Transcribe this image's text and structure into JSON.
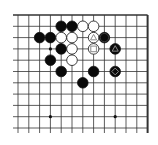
{
  "board": {
    "description": "Partial 19x19 Go board, top-right region (right and top edges visible)",
    "cols_visible": 13,
    "rows_visible": 11,
    "origin_x": 18,
    "origin_y": 15,
    "col_spacing": 10.8,
    "row_spacing": 11.3,
    "right_edge_is_border": true,
    "top_edge_is_border": true,
    "line_color": "#333333",
    "hoshi": [
      [
        3,
        3
      ],
      [
        9,
        3
      ],
      [
        3,
        9
      ],
      [
        9,
        9
      ]
    ],
    "stones": [
      {
        "color": "black",
        "col": 4,
        "row": 1
      },
      {
        "color": "black",
        "col": 5,
        "row": 1
      },
      {
        "color": "white",
        "col": 6,
        "row": 1
      },
      {
        "color": "white",
        "col": 7,
        "row": 1
      },
      {
        "color": "black",
        "col": 2,
        "row": 2
      },
      {
        "color": "black",
        "col": 3,
        "row": 2
      },
      {
        "color": "white",
        "col": 4,
        "row": 2
      },
      {
        "color": "white",
        "col": 5,
        "row": 2
      },
      {
        "color": "white",
        "col": 7,
        "row": 2,
        "mark": "triangle"
      },
      {
        "color": "black",
        "col": 8,
        "row": 2,
        "mark": "circle"
      },
      {
        "color": "black",
        "col": 4,
        "row": 3
      },
      {
        "color": "white",
        "col": 5,
        "row": 3
      },
      {
        "color": "white",
        "col": 7,
        "row": 3,
        "mark": "square"
      },
      {
        "color": "black",
        "col": 9,
        "row": 3,
        "mark": "triangle"
      },
      {
        "color": "black",
        "col": 3,
        "row": 4
      },
      {
        "color": "white",
        "col": 5,
        "row": 4
      },
      {
        "color": "black",
        "col": 4,
        "row": 5
      },
      {
        "color": "black",
        "col": 7,
        "row": 5
      },
      {
        "color": "black",
        "col": 9,
        "row": 5,
        "mark": "diamond"
      },
      {
        "color": "black",
        "col": 6,
        "row": 6
      }
    ],
    "mark_color": "#8a8a8a"
  }
}
